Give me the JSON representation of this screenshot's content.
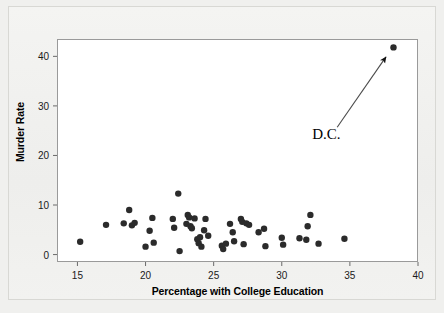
{
  "chart_data": {
    "type": "scatter",
    "title": "",
    "xlabel": "Percentage with College Education",
    "ylabel": "Murder Rate",
    "xlim": [
      13.5,
      40.0
    ],
    "ylim": [
      -1.5,
      43.5
    ],
    "xticks": [
      15,
      20,
      25,
      30,
      35,
      40
    ],
    "yticks": [
      0,
      10,
      20,
      30,
      40
    ],
    "grid": false,
    "legend": null,
    "marker": {
      "shape": "circle",
      "color": "#2b2b2b",
      "size": 3.2
    },
    "annotations": [
      {
        "text": "D.C.",
        "points_to": {
          "x": 38.2,
          "y": 41.8
        },
        "label_at": {
          "x": 33.7,
          "y": 26.5
        },
        "arrow": true
      }
    ],
    "points": [
      {
        "x": 15.2,
        "y": 2.6
      },
      {
        "x": 17.1,
        "y": 6.0
      },
      {
        "x": 18.4,
        "y": 6.3
      },
      {
        "x": 18.8,
        "y": 9.0
      },
      {
        "x": 19.0,
        "y": 5.9
      },
      {
        "x": 19.2,
        "y": 6.4
      },
      {
        "x": 20.0,
        "y": 1.6
      },
      {
        "x": 20.3,
        "y": 4.8
      },
      {
        "x": 20.5,
        "y": 7.4
      },
      {
        "x": 20.6,
        "y": 2.4
      },
      {
        "x": 22.0,
        "y": 7.2
      },
      {
        "x": 22.1,
        "y": 5.4
      },
      {
        "x": 22.4,
        "y": 12.3
      },
      {
        "x": 22.5,
        "y": 0.7
      },
      {
        "x": 23.0,
        "y": 6.2
      },
      {
        "x": 23.1,
        "y": 8.0
      },
      {
        "x": 23.2,
        "y": 7.5
      },
      {
        "x": 23.3,
        "y": 5.7
      },
      {
        "x": 23.4,
        "y": 5.3
      },
      {
        "x": 23.6,
        "y": 7.3
      },
      {
        "x": 23.8,
        "y": 3.1
      },
      {
        "x": 23.9,
        "y": 2.3
      },
      {
        "x": 24.0,
        "y": 3.5
      },
      {
        "x": 24.1,
        "y": 1.6
      },
      {
        "x": 24.3,
        "y": 4.9
      },
      {
        "x": 24.4,
        "y": 7.2
      },
      {
        "x": 24.6,
        "y": 3.8
      },
      {
        "x": 25.6,
        "y": 1.8
      },
      {
        "x": 25.7,
        "y": 1.1
      },
      {
        "x": 25.9,
        "y": 2.2
      },
      {
        "x": 26.2,
        "y": 6.2
      },
      {
        "x": 26.4,
        "y": 4.5
      },
      {
        "x": 26.5,
        "y": 2.7
      },
      {
        "x": 27.0,
        "y": 7.2
      },
      {
        "x": 27.1,
        "y": 6.6
      },
      {
        "x": 27.2,
        "y": 2.1
      },
      {
        "x": 27.4,
        "y": 6.3
      },
      {
        "x": 27.6,
        "y": 6.0
      },
      {
        "x": 28.3,
        "y": 4.5
      },
      {
        "x": 28.7,
        "y": 5.2
      },
      {
        "x": 28.8,
        "y": 1.7
      },
      {
        "x": 30.0,
        "y": 3.4
      },
      {
        "x": 30.1,
        "y": 2.0
      },
      {
        "x": 31.3,
        "y": 3.3
      },
      {
        "x": 31.8,
        "y": 3.0
      },
      {
        "x": 31.9,
        "y": 5.7
      },
      {
        "x": 32.1,
        "y": 8.0
      },
      {
        "x": 32.7,
        "y": 2.2
      },
      {
        "x": 34.6,
        "y": 3.2
      },
      {
        "x": 38.2,
        "y": 41.8
      }
    ]
  },
  "axes": {
    "x_title": "Percentage with College Education",
    "y_title": "Murder Rate",
    "x_tick_labels": [
      "15",
      "20",
      "25",
      "30",
      "35",
      "40"
    ],
    "y_tick_labels": [
      "0",
      "10",
      "20",
      "30",
      "40"
    ]
  },
  "annotation": {
    "label": "D.C."
  },
  "colors": {
    "marker": "#2b2b2b",
    "frame": "#9a9a9a",
    "plot_background": "#ffffff",
    "figure_background": "#f1f1ef",
    "text": "#000000"
  }
}
